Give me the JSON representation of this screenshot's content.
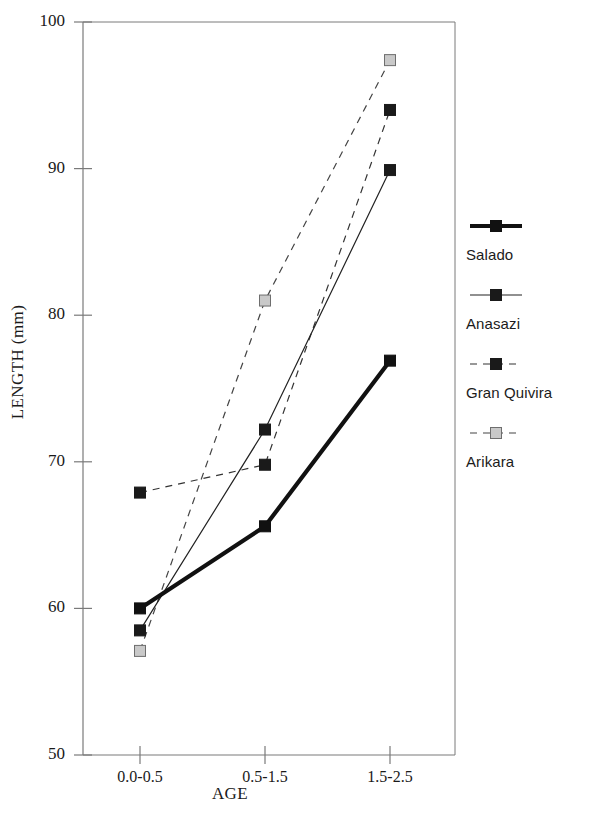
{
  "chart_data": {
    "type": "line",
    "title": "",
    "xlabel": "AGE",
    "ylabel": "LENGTH (mm)",
    "categories": [
      "0.0-0.5",
      "0.5-1.5",
      "1.5-2.5"
    ],
    "ylim": [
      50,
      100
    ],
    "yticks": [
      50,
      60,
      70,
      80,
      90,
      100
    ],
    "ytick_labels": [
      "50",
      "60",
      "70",
      "80",
      "90",
      "100"
    ],
    "grid": false,
    "legend_position": "right",
    "series": [
      {
        "name": "Salado",
        "values": [
          60.0,
          65.6,
          76.9
        ],
        "color": "#111111",
        "line_style": "solid",
        "line_width": 4.2,
        "marker": "square",
        "marker_fill": "#111111"
      },
      {
        "name": "Anasazi",
        "values": [
          58.5,
          72.2,
          89.9
        ],
        "color": "#222222",
        "line_style": "solid",
        "line_width": 1.2,
        "marker": "square",
        "marker_fill": "#1a1a1a"
      },
      {
        "name": "Gran Quivira",
        "values": [
          67.9,
          69.8,
          94.0
        ],
        "color": "#333333",
        "line_style": "dashed",
        "line_width": 1.2,
        "marker": "square",
        "marker_fill": "#1a1a1a"
      },
      {
        "name": "Arikara",
        "values": [
          57.1,
          81.0,
          97.4
        ],
        "color": "#444444",
        "line_style": "dashed",
        "line_width": 1.2,
        "marker": "square",
        "marker_fill": "#c9c9c9"
      }
    ]
  }
}
